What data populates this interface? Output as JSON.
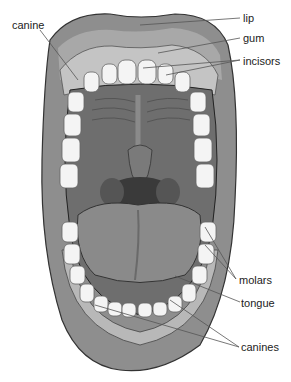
{
  "diagram": {
    "labels": {
      "lip": "lip",
      "gum": "gum",
      "incisors": "incisors",
      "canine": "canine",
      "molars": "molars",
      "tongue": "tongue",
      "canines": "canines"
    },
    "colors": {
      "lip": "#8e8e8e",
      "lip_light": "#a8a8a8",
      "gum": "#c4c4c4",
      "teeth": "#f4f4f4",
      "palate": "#6e6e6e",
      "throat": "#3a3a3a",
      "tongue": "#8a8a8a",
      "leader_line": "#555555"
    }
  }
}
